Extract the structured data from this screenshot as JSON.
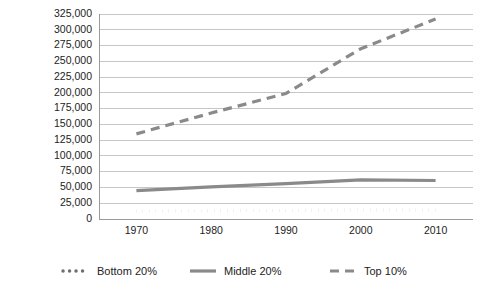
{
  "chart_data": {
    "type": "line",
    "title": "",
    "subtitle": "",
    "xlabel": "",
    "ylabel": "",
    "x": [
      1970,
      1980,
      1990,
      2000,
      2010
    ],
    "xtick_labels": [
      "1970",
      "1980",
      "1990",
      "2000",
      "2010"
    ],
    "xlim": [
      1965,
      2015
    ],
    "ylim": [
      0,
      325000
    ],
    "ytick_values": [
      0,
      25000,
      50000,
      75000,
      100000,
      125000,
      150000,
      175000,
      200000,
      225000,
      250000,
      275000,
      300000,
      325000
    ],
    "ytick_labels": [
      "0",
      "25,000",
      "50,000",
      "75,000",
      "100,000",
      "125,000",
      "150,000",
      "175,000",
      "200,000",
      "225,000",
      "250,000",
      "275,000",
      "300,000",
      "325,000"
    ],
    "grid": true,
    "legend_position": "bottom",
    "series": [
      {
        "name": "Bottom 20%",
        "style": "dotted",
        "color": "#6f6f6f",
        "values": [
          12500,
          13000,
          13500,
          14500,
          14000
        ]
      },
      {
        "name": "Middle 20%",
        "style": "solid",
        "color": "#8a8a8a",
        "values": [
          45000,
          51000,
          56000,
          62000,
          61000
        ]
      },
      {
        "name": "Top 10%",
        "style": "dashed",
        "color": "#8a8a8a",
        "values": [
          135000,
          168000,
          199000,
          270000,
          317000
        ]
      }
    ]
  },
  "legend": {
    "items": [
      {
        "label": "Bottom 20%",
        "marker": "dotted-line-swatch"
      },
      {
        "label": "Middle 20%",
        "marker": "solid-line-swatch"
      },
      {
        "label": "Top 10%",
        "marker": "dashed-line-swatch"
      }
    ]
  },
  "colors": {
    "gridline": "#b8b8b8",
    "axis": "#9a9a9a",
    "text": "#222222",
    "background": "#ffffff"
  }
}
